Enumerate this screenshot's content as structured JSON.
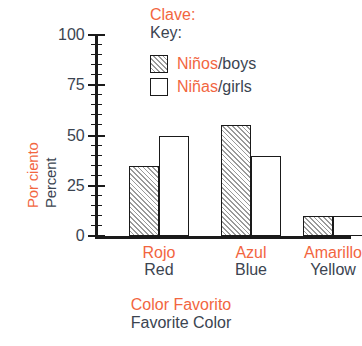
{
  "chart_data": {
    "type": "bar",
    "title": "",
    "subtitle": "",
    "categories": [
      "Rojo / Red",
      "Azul / Blue",
      "Amarillo / Yellow"
    ],
    "category_labels": [
      {
        "es": "Rojo",
        "en": "Red"
      },
      {
        "es": "Azul",
        "en": "Blue"
      },
      {
        "es": "Amarillo",
        "en": "Yellow"
      }
    ],
    "series": [
      {
        "name": "Niños/boys",
        "values": [
          35,
          55,
          10
        ]
      },
      {
        "name": "Niñas/girls",
        "values": [
          50,
          40,
          10
        ]
      }
    ],
    "xlabel": "Color Favorito / Favorite Color",
    "ylabel": "Por ciento / Percent",
    "ylim": [
      0,
      100
    ],
    "ytick_values": [
      0,
      25,
      50,
      75,
      100
    ],
    "ytick_labels": [
      "0",
      "25",
      "50",
      "75",
      "100"
    ],
    "yminor_step": 5,
    "grid": false,
    "legend_position": "top-right"
  },
  "axes": {
    "y_title": {
      "es": "Por ciento",
      "en": "Percent"
    },
    "x_title": {
      "es": "Color Favorito",
      "en": "Favorite Color"
    },
    "y_ticks": [
      {
        "label": "100",
        "value": 100
      },
      {
        "label": "75",
        "value": 75
      },
      {
        "label": "50",
        "value": 50
      },
      {
        "label": "25",
        "value": 25
      },
      {
        "label": "0",
        "value": 0
      }
    ]
  },
  "legend": {
    "title": {
      "es": "Clave:",
      "en": "Key:"
    },
    "items": [
      {
        "es": "Niños",
        "en": "/boys",
        "pattern": "hatched"
      },
      {
        "es": "Niñas",
        "en": "/girls",
        "pattern": "open"
      }
    ]
  },
  "colors": {
    "spanish_text": "#F2663F",
    "english_text": "#3B4450",
    "axis": "#1a1a1a",
    "bar_outline": "#1a1a1a",
    "hatch": "#9a9a9a",
    "background": "#ffffff"
  }
}
